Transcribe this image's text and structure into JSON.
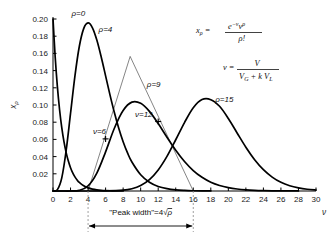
{
  "chart_data": {
    "type": "line",
    "title": "",
    "xlabel": "ν",
    "ylabel": "xρ",
    "xlim": [
      0,
      30
    ],
    "ylim": [
      0,
      0.2
    ],
    "grid": false,
    "legend_position": "inline-curve-labels",
    "x_ticks": [
      "0",
      "2",
      "4",
      "6",
      "8",
      "10",
      "12",
      "14",
      "16",
      "18",
      "20",
      "22",
      "24",
      "26",
      "28",
      "30"
    ],
    "x_tick_values": [
      0,
      2,
      4,
      6,
      8,
      10,
      12,
      14,
      16,
      18,
      20,
      22,
      24,
      26,
      28,
      30
    ],
    "y_ticks": [
      "0.02",
      "0.04",
      "0.06",
      "0.08",
      "0.10",
      "0.12",
      "0.14",
      "0.16",
      "0.18",
      "0.20"
    ],
    "y_tick_values": [
      0.02,
      0.04,
      0.06,
      0.08,
      0.1,
      0.12,
      0.14,
      0.16,
      0.18,
      0.2
    ],
    "series": [
      {
        "name": "ρ=0",
        "label": "ρ=0",
        "label_x": 2.1,
        "label_y": 0.204,
        "peak_x": 0,
        "peak_y": 0.2,
        "x": [
          0,
          0.25,
          0.5,
          0.75,
          1,
          1.25,
          1.5,
          1.75,
          2,
          2.25,
          2.5,
          2.75,
          3,
          3.5,
          4,
          4.5,
          5,
          5.5,
          6,
          6.5,
          7,
          7.5,
          8
        ],
        "values": [
          0.2,
          0.1558,
          0.1213,
          0.0945,
          0.0736,
          0.0573,
          0.0446,
          0.0348,
          0.0271,
          0.0211,
          0.0164,
          0.0128,
          0.00995,
          0.00604,
          0.00366,
          0.00222,
          0.00135,
          0.00082,
          0.0005,
          0.0003,
          0.00018,
          0.00011,
          7e-05
        ]
      },
      {
        "name": "ρ=4",
        "label": "ρ=4",
        "label_x": 5.2,
        "label_y": 0.1845,
        "peak_x": 4,
        "peak_y": 0.1954,
        "x": [
          0,
          0.5,
          1,
          1.5,
          2,
          2.5,
          3,
          3.5,
          4,
          4.5,
          5,
          5.5,
          6,
          6.5,
          7,
          7.5,
          8,
          8.5,
          9,
          10,
          11,
          12,
          13,
          14,
          15,
          16,
          17,
          18
        ],
        "values": [
          0,
          0.0016,
          0.0153,
          0.0471,
          0.0902,
          0.1336,
          0.168,
          0.1888,
          0.1954,
          0.1898,
          0.1755,
          0.1558,
          0.1339,
          0.1118,
          0.0912,
          0.0729,
          0.0573,
          0.0443,
          0.0337,
          0.0189,
          0.0102,
          0.0053,
          0.0027,
          0.0013,
          0.00065,
          0.00031,
          0.00015,
          7e-05
        ]
      },
      {
        "name": "ρ=9",
        "label": "ρ=9",
        "label_x": 10.7,
        "label_y": 0.1213,
        "peak_x": 9,
        "peak_y": 0.1318,
        "x": [
          0,
          1,
          2,
          3,
          4,
          5,
          6,
          7,
          8,
          9,
          10,
          11,
          12,
          13,
          14,
          15,
          16,
          17,
          18,
          19,
          20,
          21,
          22,
          23,
          24,
          25,
          26,
          27,
          28
        ],
        "values": [
          0,
          1e-07,
          1.69e-05,
          0.00075,
          0.00595,
          0.0208,
          0.0455,
          0.073,
          0.0936,
          0.1033,
          0.102,
          0.0926,
          0.0784,
          0.0626,
          0.0474,
          0.0343,
          0.0238,
          0.0159,
          0.0102,
          0.0064,
          0.0039,
          0.0023,
          0.0013,
          0.0007,
          0.00038,
          0.0002,
          0.0001,
          5e-05,
          3e-05
        ]
      },
      {
        "name": "ρ=15",
        "label": "ρ=15",
        "label_x": 18.5,
        "label_y": 0.1035,
        "peak_x": 15,
        "peak_y": 0.1024,
        "x": [
          0,
          2,
          4,
          6,
          8,
          9,
          10,
          11,
          12,
          13,
          14,
          15,
          16,
          17,
          18,
          19,
          20,
          21,
          22,
          23,
          24,
          25,
          26,
          27,
          28,
          29,
          30
        ],
        "values": [
          0,
          0,
          1e-06,
          5e-05,
          0.00093,
          0.0026,
          0.0063,
          0.0132,
          0.0245,
          0.0403,
          0.0596,
          0.0796,
          0.0968,
          0.1063,
          0.1062,
          0.0985,
          0.0843,
          0.0675,
          0.0509,
          0.0364,
          0.0248,
          0.0162,
          0.0101,
          0.0061,
          0.0036,
          0.002,
          0.0011
        ]
      }
    ],
    "markers": [
      {
        "name": "ν=6",
        "label": "ν=6",
        "symbol": "+",
        "x": 6,
        "y": 0.0606,
        "label_x": 4.55,
        "label_y": 0.0666
      },
      {
        "name": "ν=12",
        "label": "ν=12",
        "symbol": "+",
        "x": 12,
        "y": 0.0808,
        "label_x": 9.35,
        "label_y": 0.0862
      }
    ],
    "annotations": {
      "peak_width": {
        "text_prefix": "\"Peak width\"=4",
        "radical": "√",
        "radicand": "ρ",
        "full_text": "\"Peak width\"=4√ρ",
        "from_x": 4,
        "to_x": 16,
        "guide_x_values": [
          4,
          16
        ]
      },
      "tangent_triangle": {
        "apex_x": 8.8,
        "apex_y": 0.1565,
        "left_base_x": 4,
        "left_base_y": 0,
        "right_base_x": 16,
        "right_base_y": 0
      }
    },
    "formulas": [
      {
        "name": "poisson-probability",
        "lhs": "x",
        "lhs_sub": "ρ",
        "eq": "=",
        "numerator": "e",
        "numerator_exp": "−ν",
        "numerator_var": "ν",
        "numerator_var_exp": "ρ",
        "denominator": "ρ!",
        "plain": "xρ = e^(−ν) ν^ρ / ρ!"
      },
      {
        "name": "nu-definition",
        "lhs": "ν",
        "eq": "=",
        "numerator": "V",
        "denominator_a": "V",
        "denominator_a_sub": "G",
        "denominator_plus": "+",
        "denominator_b": "k V",
        "denominator_b_sub": "L",
        "plain": "ν = V / (V_G + kV_L)"
      }
    ],
    "colors": {
      "curve": "#000000",
      "axis": "#000000",
      "text": "#111111",
      "guide": "#888888",
      "thin_line": "#333333",
      "background": "#ffffff"
    }
  }
}
